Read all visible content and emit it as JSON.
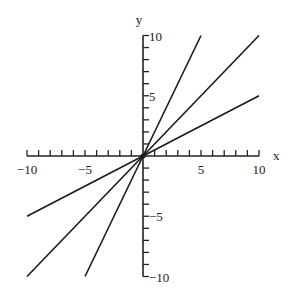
{
  "chart_data": {
    "type": "line",
    "title": "",
    "xlabel": "x",
    "ylabel": "y",
    "xlim": [
      -10,
      10
    ],
    "ylim": [
      -10,
      10
    ],
    "x_ticks_labeled": [
      -10,
      -5,
      5,
      10
    ],
    "y_ticks_labeled": [
      10,
      5,
      -5,
      -10
    ],
    "x_tick_labels": [
      "−10",
      "−5",
      "5",
      "10"
    ],
    "y_tick_labels": [
      "10",
      "5",
      "−5",
      "−10"
    ],
    "grid": false,
    "legend": null,
    "series": [
      {
        "name": "y = 2x",
        "x": [
          -5,
          5
        ],
        "y": [
          -10,
          10
        ]
      },
      {
        "name": "y = x",
        "x": [
          -10,
          10
        ],
        "y": [
          -10,
          10
        ]
      },
      {
        "name": "y = 0.5x",
        "x": [
          -10,
          10
        ],
        "y": [
          -5,
          5
        ]
      }
    ]
  },
  "style": {
    "axis_color": "#222222",
    "line_color": "#1a1a1a"
  }
}
